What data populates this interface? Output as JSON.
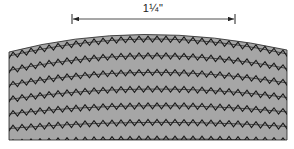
{
  "dimension": {
    "label": "1¼\"",
    "x_start": 72,
    "x_end": 235,
    "y": 19
  },
  "swatch": {
    "fill_color": "#a6a6a6",
    "stitch_color": "#1a1a1a",
    "stitch_rows": 7,
    "stitch_type": "zigzag"
  }
}
